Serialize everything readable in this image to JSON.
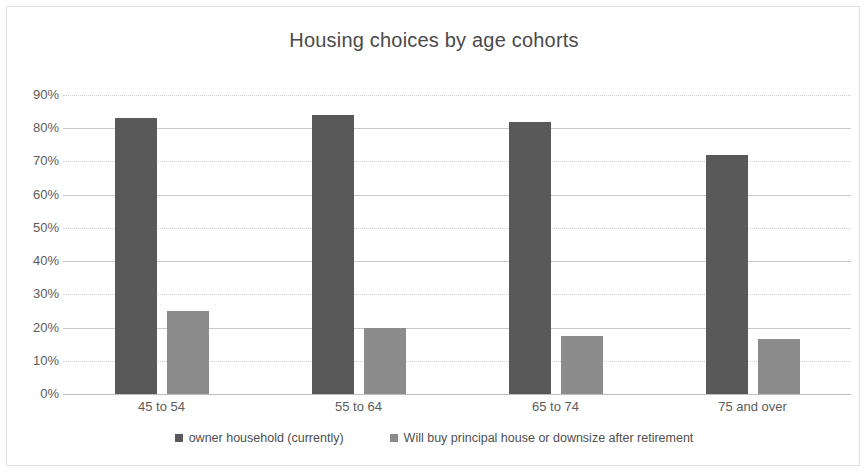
{
  "chart_data": {
    "type": "bar",
    "title": "Housing choices by age cohorts",
    "xlabel": "",
    "ylabel": "",
    "ylim": [
      0,
      90
    ],
    "ytick_values": [
      0,
      10,
      20,
      30,
      40,
      50,
      60,
      70,
      80,
      90
    ],
    "ytick_labels": [
      "0%",
      "10%",
      "20%",
      "30%",
      "40%",
      "50%",
      "60%",
      "70%",
      "80%",
      "90%"
    ],
    "categories": [
      "45 to 54",
      "55 to 64",
      "65 to 74",
      "75 and over"
    ],
    "series": [
      {
        "name": "owner household (currently)",
        "color": "#595959",
        "values": [
          83,
          84,
          82,
          72
        ]
      },
      {
        "name": "Will buy principal house or downsize after retirement",
        "color": "#8c8c8c",
        "values": [
          25,
          20,
          17.5,
          16.5
        ]
      }
    ],
    "grid": true,
    "grid_axis": "y",
    "legend_position": "bottom",
    "border": true,
    "border_color": "#e2e2e2",
    "background": "#ffffff",
    "title_color": "#4a4a4a",
    "tick_color": "#5c5c5c"
  }
}
